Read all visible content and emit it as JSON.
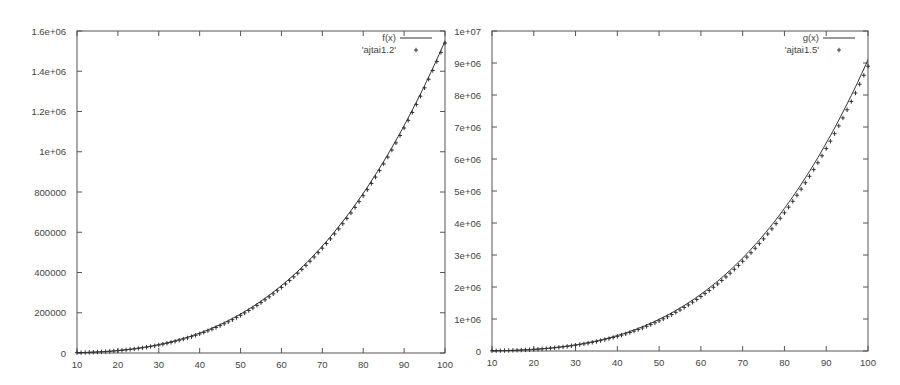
{
  "chart_data": [
    {
      "type": "line",
      "title": "",
      "xlabel": "",
      "ylabel": "",
      "xlim": [
        10,
        100
      ],
      "ylim": [
        0,
        1600000
      ],
      "x_ticks": [
        "10",
        "20",
        "30",
        "40",
        "50",
        "60",
        "70",
        "80",
        "90",
        "100"
      ],
      "y_ticks": [
        "0",
        "200000",
        "400000",
        "600000",
        "800000",
        "1e+06",
        "1.2e+06",
        "1.4e+06",
        "1.6e+06"
      ],
      "grid": false,
      "legend_position": "top-right",
      "series": [
        {
          "name": "f(x)",
          "style": "line",
          "x": [
            10,
            20,
            30,
            40,
            50,
            60,
            70,
            80,
            90,
            100
          ],
          "values": [
            1550,
            12400,
            41850,
            99200,
            193750,
            334800,
            531650,
            793600,
            1129950,
            1550000
          ]
        },
        {
          "name": "'ajtai1.2'",
          "style": "points",
          "x": [
            10,
            20,
            30,
            40,
            50,
            60,
            70,
            80,
            90,
            100
          ],
          "values": [
            1300,
            10800,
            37500,
            90000,
            178000,
            312000,
            500000,
            760000,
            1100000,
            1540000
          ]
        }
      ]
    },
    {
      "type": "line",
      "title": "",
      "xlabel": "",
      "ylabel": "",
      "xlim": [
        10,
        100
      ],
      "ylim": [
        0,
        10000000
      ],
      "x_ticks": [
        "10",
        "20",
        "30",
        "40",
        "50",
        "60",
        "70",
        "80",
        "90",
        "100"
      ],
      "y_ticks": [
        "0",
        "1e+06",
        "2e+06",
        "3e+06",
        "4e+06",
        "5e+06",
        "6e+06",
        "7e+06",
        "8e+06",
        "9e+06",
        "1e+07"
      ],
      "grid": false,
      "legend_position": "top-right",
      "series": [
        {
          "name": "g(x)",
          "style": "line",
          "x": [
            10,
            20,
            30,
            40,
            50,
            60,
            70,
            80,
            90,
            100
          ],
          "values": [
            3000,
            38000,
            160000,
            380000,
            800000,
            1450000,
            2600000,
            4100000,
            6300000,
            9100000
          ]
        },
        {
          "name": "'ajtai1.5'",
          "style": "points",
          "x": [
            10,
            20,
            30,
            40,
            50,
            60,
            70,
            80,
            90,
            100
          ],
          "values": [
            2500,
            33000,
            145000,
            350000,
            750000,
            1380000,
            2500000,
            4000000,
            6200000,
            8900000
          ]
        }
      ]
    }
  ],
  "plots": [
    {
      "legend": {
        "line_label": "f(x)",
        "points_label": "'ajtai1.2'"
      },
      "exponent": 3.0,
      "line_coef": 1.55,
      "points_scale": 0.96,
      "points_max_x": 100
    },
    {
      "legend": {
        "line_label": "g(x)",
        "points_label": "'ajtai1.5'"
      },
      "exponent": 3.2,
      "line_coef": 3.6,
      "points_scale": 0.965,
      "points_max_x": 100
    }
  ]
}
